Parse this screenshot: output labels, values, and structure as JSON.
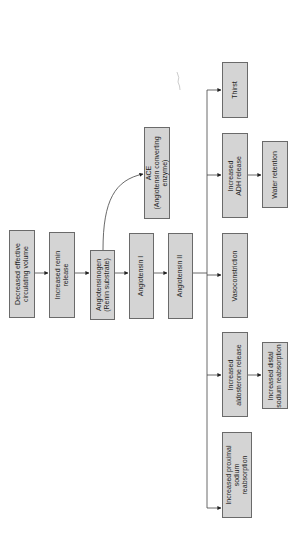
{
  "diagram": {
    "orientation": "rotated 90 degrees counter-clockwise",
    "colors": {
      "box_fill": "#d4d4d4",
      "box_border": "#6a6a6a",
      "line": "#444444",
      "text": "#1e1e1e"
    },
    "nodes": {
      "n1": "Decreased effective\ncirculating volume",
      "n2": "Increased renin\nrelease",
      "n3": "Angiotensinogen\n(Renin substrate)",
      "n4": "ACE\n(Angiotensin converting\nenzyme)",
      "n5": "Angiotensin I",
      "n6": "Angiotensin II",
      "n7": "Thirst",
      "n8": "Increased\nADH release",
      "n9": "Water retention",
      "n10": "Vasoconstriction",
      "n11": "Increased\naldosterone release",
      "n12": "Increased distal\nsodium reabsorption",
      "n13": "Increased proximal\nsodium\nreabsorption"
    },
    "edges": [
      [
        "n1",
        "n2"
      ],
      [
        "n2",
        "n3"
      ],
      [
        "n3",
        "n4"
      ],
      [
        "n3",
        "n5"
      ],
      [
        "n5",
        "n6"
      ],
      [
        "n6",
        "n7"
      ],
      [
        "n6",
        "n8"
      ],
      [
        "n6",
        "n10"
      ],
      [
        "n6",
        "n11"
      ],
      [
        "n6",
        "n13"
      ],
      [
        "n8",
        "n9"
      ],
      [
        "n11",
        "n12"
      ]
    ]
  }
}
